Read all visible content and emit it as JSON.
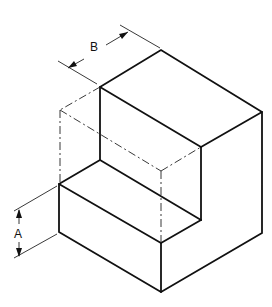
{
  "figure": {
    "type": "isometric technical drawing",
    "dimensions": [
      {
        "label": "A",
        "describes": "height of the lower step"
      },
      {
        "label": "B",
        "describes": "depth of the upper block"
      }
    ],
    "colors": {
      "line": "#111111",
      "background": "#ffffff"
    }
  }
}
